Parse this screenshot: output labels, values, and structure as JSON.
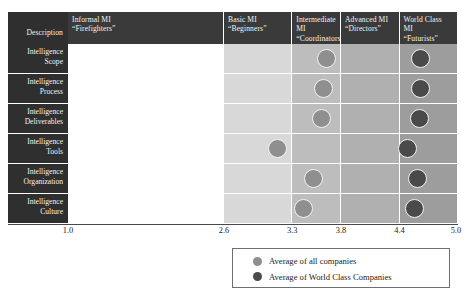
{
  "table": {
    "description_header": "Description",
    "column_headers": [
      {
        "line1": "Informal MI",
        "line2": "“Firefighters”"
      },
      {
        "line1": "Basic MI",
        "line2": "“Beginners”"
      },
      {
        "line1": "Intermediate MI",
        "line2": "“Coordinators”"
      },
      {
        "line1": "Advanced MI",
        "line2": "“Directors”"
      },
      {
        "line1": "World Class MI",
        "line2": "“Futurists”"
      }
    ],
    "row_labels": [
      {
        "line1": "Intelligence",
        "line2": "Scope"
      },
      {
        "line1": "Intelligence",
        "line2": "Process"
      },
      {
        "line1": "Intelligence",
        "line2": "Deliverables"
      },
      {
        "line1": "Intelligence",
        "line2": "Tools"
      },
      {
        "line1": "Intelligence",
        "line2": "Organization"
      },
      {
        "line1": "Intelligence",
        "line2": "Culture"
      }
    ]
  },
  "axis": {
    "ticks": [
      "1.0",
      "2.6",
      "3.3",
      "3.8",
      "4.4",
      "5.0"
    ]
  },
  "legend": {
    "items": [
      {
        "label": "Average of all companies",
        "marker": "light-dot"
      },
      {
        "label": "Average of World Class Companies",
        "marker": "dark-dot"
      }
    ]
  },
  "colors": {
    "header_dark": "#3a3a3a",
    "label_dark": "#2f2f2f",
    "dot_light": "#8f8f8f",
    "dot_dark": "#4a4a4a",
    "band_1": "#ffffff",
    "band_2": "#d8d8d8",
    "band_3": "#bdbdbd",
    "band_4": "#b0b0b0",
    "band_5": "#9d9d9d"
  },
  "chart_data": {
    "type": "scatter",
    "title": "",
    "xlabel": "",
    "ylabel": "",
    "xlim": [
      1.0,
      5.0
    ],
    "grid": false,
    "legend_position": "bottom-right",
    "axis_ticks": [
      1.0,
      2.6,
      3.3,
      3.8,
      4.4,
      5.0
    ],
    "maturity_bands": [
      {
        "name": "Informal MI “Firefighters”",
        "range": [
          1.0,
          2.6
        ]
      },
      {
        "name": "Basic MI “Beginners”",
        "range": [
          2.6,
          3.3
        ]
      },
      {
        "name": "Intermediate MI “Coordinators”",
        "range": [
          3.3,
          3.8
        ]
      },
      {
        "name": "Advanced MI “Directors”",
        "range": [
          3.8,
          4.4
        ]
      },
      {
        "name": "World Class MI “Futurists”",
        "range": [
          4.4,
          5.0
        ]
      }
    ],
    "categories": [
      "Intelligence Scope",
      "Intelligence Process",
      "Intelligence Deliverables",
      "Intelligence Tools",
      "Intelligence Organization",
      "Intelligence Culture"
    ],
    "series": [
      {
        "name": "Average of all companies",
        "color": "#8f8f8f",
        "values": [
          3.65,
          3.62,
          3.6,
          3.15,
          3.52,
          3.42
        ]
      },
      {
        "name": "Average of World Class Companies",
        "color": "#4a4a4a",
        "values": [
          4.62,
          4.62,
          4.6,
          4.48,
          4.58,
          4.55
        ]
      }
    ]
  }
}
